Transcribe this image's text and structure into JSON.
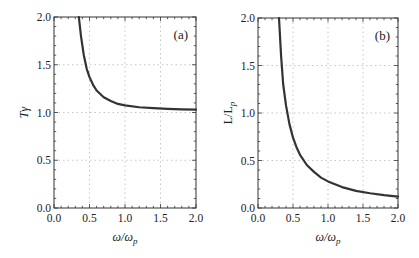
{
  "chart_data": [
    {
      "type": "line",
      "panel": "(a)",
      "title": "",
      "xlabel": "ω/ω_p",
      "ylabel": "Tγ",
      "xlim": [
        0.0,
        2.0
      ],
      "ylim": [
        0.0,
        2.0
      ],
      "xticks": [
        "0.0",
        "0.5",
        "1.0",
        "1.5",
        "2.0"
      ],
      "yticks": [
        "0.0",
        "0.5",
        "1.0",
        "1.5",
        "2.0"
      ],
      "grid": true,
      "series": [
        {
          "name": "Tγ",
          "color": "#333333",
          "x": [
            0.35,
            0.38,
            0.42,
            0.46,
            0.5,
            0.55,
            0.6,
            0.7,
            0.8,
            0.9,
            1.0,
            1.2,
            1.4,
            1.6,
            1.8,
            2.0
          ],
          "y": [
            2.0,
            1.8,
            1.6,
            1.46,
            1.37,
            1.29,
            1.23,
            1.16,
            1.12,
            1.09,
            1.075,
            1.055,
            1.045,
            1.038,
            1.033,
            1.03
          ]
        }
      ]
    },
    {
      "type": "line",
      "panel": "(b)",
      "title": "",
      "xlabel": "ω/ω_p",
      "ylabel": "L/L_p",
      "xlim": [
        0.0,
        2.0
      ],
      "ylim": [
        0.0,
        2.0
      ],
      "xticks": [
        "0.0",
        "0.5",
        "1.0",
        "1.5",
        "2.0"
      ],
      "yticks": [
        "0.0",
        "0.5",
        "1.0",
        "1.5",
        "2.0"
      ],
      "grid": true,
      "series": [
        {
          "name": "L/L_p",
          "color": "#333333",
          "x": [
            0.3,
            0.33,
            0.36,
            0.4,
            0.45,
            0.5,
            0.55,
            0.6,
            0.7,
            0.8,
            0.9,
            1.0,
            1.2,
            1.4,
            1.6,
            1.8,
            2.0
          ],
          "y": [
            2.0,
            1.6,
            1.3,
            1.08,
            0.88,
            0.74,
            0.64,
            0.56,
            0.45,
            0.38,
            0.32,
            0.28,
            0.22,
            0.18,
            0.155,
            0.135,
            0.12
          ]
        }
      ]
    }
  ],
  "panels": {
    "a": {
      "tag": "(a)",
      "ylabel": "Tγ",
      "xlabel_main": "ω/ω",
      "xlabel_sub": "p"
    },
    "b": {
      "tag": "(b)",
      "ylabel_main": "L/L",
      "ylabel_sub": "p",
      "xlabel_main": "ω/ω",
      "xlabel_sub": "p"
    }
  }
}
